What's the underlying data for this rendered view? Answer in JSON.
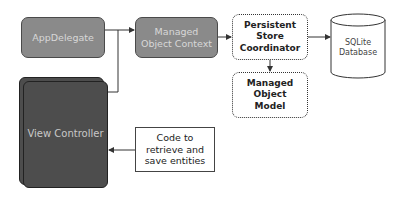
{
  "diagram": {
    "nodes": {
      "app_delegate": {
        "label": "AppDelegate"
      },
      "managed_object_context": {
        "label": "Managed Object Context"
      },
      "persistent_store_coordinator": {
        "label": "Persistent Store Coordinator"
      },
      "managed_object_model": {
        "label": "Managed Object Model"
      },
      "sqlite_database": {
        "label_line1": "SQLite",
        "label_line2": "Database"
      },
      "view_controller": {
        "label": "View Controller"
      },
      "code_note": {
        "label": "Code to retrieve and save entities"
      }
    },
    "edges": [
      {
        "from": "app_delegate",
        "to": "managed_object_context"
      },
      {
        "from": "view_controller",
        "to": "managed_object_context"
      },
      {
        "from": "managed_object_context",
        "to": "persistent_store_coordinator"
      },
      {
        "from": "persistent_store_coordinator",
        "to": "sqlite_database"
      },
      {
        "from": "persistent_store_coordinator",
        "to": "managed_object_model"
      },
      {
        "from": "code_note",
        "to": "view_controller"
      }
    ],
    "colors": {
      "context_nodes": "#8a8a8a",
      "view_controller": "#4d4d4d",
      "lines": "#333333"
    }
  }
}
